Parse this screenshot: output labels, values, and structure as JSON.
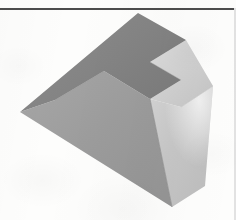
{
  "page": {
    "kind": "scanned-figure",
    "background_color": "#fdfdfc",
    "width": 236,
    "height": 220,
    "caption": "",
    "rules": {
      "top_rule_color": "#4c4c4c",
      "top_rule_y": 8,
      "right_rule_color": "#e2e2e2"
    }
  },
  "figure": {
    "title": "",
    "projection": "isometric",
    "palette": {
      "top_face": "#8a8a8a",
      "top_face_dark": "#7e7e7e",
      "left_face": "#a0a0a0",
      "left_face_shadow": "#969696",
      "notch_face": "#cfcfcf",
      "right_face": "#c9c9c9",
      "right_face_light": "#dedede",
      "front_right_face": "#b9b9b9",
      "edge": "#6f6f6f",
      "highlight": "#efefef"
    },
    "faces": [
      {
        "id": "top-face",
        "label": "top face",
        "fill": "#868686",
        "points": "138,13 186,40 150,62 181,80 150,99 104,71 55,100 20,112"
      },
      {
        "id": "upper-right-face",
        "label": "upper right light face",
        "fill": "#cfcfcf",
        "points": "186,40 213,86 181,107 150,99 181,80 150,62"
      },
      {
        "id": "left-face",
        "label": "left vertical face",
        "fill": "#9d9d9d",
        "points": "20,112 55,100 104,71 150,99 172,207"
      },
      {
        "id": "right-face",
        "label": "lower right face",
        "fill": "#c4c4c4",
        "points": "150,99 181,107 213,86 205,186 172,207"
      }
    ],
    "vertices": [
      {
        "name": "apex-top",
        "x": 138,
        "y": 13
      },
      {
        "name": "right-upper",
        "x": 186,
        "y": 40
      },
      {
        "name": "notch-inner",
        "x": 150,
        "y": 62
      },
      {
        "name": "notch-outer",
        "x": 181,
        "y": 80
      },
      {
        "name": "center-front",
        "x": 150,
        "y": 99
      },
      {
        "name": "ridge-left",
        "x": 104,
        "y": 71
      },
      {
        "name": "left-upper",
        "x": 55,
        "y": 100
      },
      {
        "name": "left-corner",
        "x": 20,
        "y": 112
      },
      {
        "name": "right-corner",
        "x": 213,
        "y": 86
      },
      {
        "name": "bottom-front",
        "x": 172,
        "y": 207
      },
      {
        "name": "bottom-right",
        "x": 205,
        "y": 186
      }
    ]
  }
}
